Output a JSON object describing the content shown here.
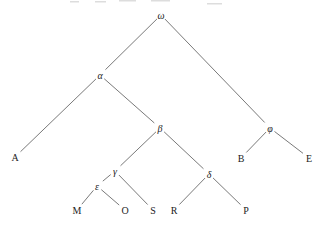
{
  "figure": {
    "width": 323,
    "height": 228,
    "background_color": "#ffffff",
    "edge_color": "#6a6a6a",
    "edge_width": 0.9,
    "label_color": "#222222"
  },
  "tree": {
    "type": "tree",
    "root": "omega",
    "nodes": [
      {
        "id": "omega",
        "label": "ω",
        "greek": true,
        "x": 161,
        "y": 15
      },
      {
        "id": "alpha",
        "label": "α",
        "greek": true,
        "x": 100,
        "y": 75
      },
      {
        "id": "phi",
        "label": "φ",
        "greek": true,
        "x": 270,
        "y": 128
      },
      {
        "id": "beta",
        "label": "β",
        "greek": true,
        "x": 160,
        "y": 128
      },
      {
        "id": "gamma",
        "label": "γ",
        "greek": true,
        "x": 115,
        "y": 171
      },
      {
        "id": "delta",
        "label": "δ",
        "greek": true,
        "x": 209,
        "y": 174
      },
      {
        "id": "epsilon",
        "label": "ε",
        "greek": true,
        "x": 97,
        "y": 186
      },
      {
        "id": "A",
        "label": "A",
        "greek": false,
        "x": 15,
        "y": 157
      },
      {
        "id": "B",
        "label": "B",
        "greek": false,
        "x": 241,
        "y": 158
      },
      {
        "id": "E",
        "label": "E",
        "greek": false,
        "x": 309,
        "y": 158
      },
      {
        "id": "M",
        "label": "M",
        "greek": false,
        "x": 77,
        "y": 210
      },
      {
        "id": "O",
        "label": "O",
        "greek": false,
        "x": 125,
        "y": 210
      },
      {
        "id": "S",
        "label": "S",
        "greek": false,
        "x": 153,
        "y": 210
      },
      {
        "id": "R",
        "label": "R",
        "greek": false,
        "x": 174,
        "y": 210
      },
      {
        "id": "P",
        "label": "P",
        "greek": false,
        "x": 246,
        "y": 210
      }
    ],
    "edges": [
      [
        "omega",
        "alpha"
      ],
      [
        "omega",
        "phi"
      ],
      [
        "alpha",
        "A"
      ],
      [
        "alpha",
        "beta"
      ],
      [
        "beta",
        "gamma"
      ],
      [
        "beta",
        "delta"
      ],
      [
        "gamma",
        "epsilon"
      ],
      [
        "gamma",
        "S"
      ],
      [
        "epsilon",
        "M"
      ],
      [
        "epsilon",
        "O"
      ],
      [
        "delta",
        "R"
      ],
      [
        "delta",
        "P"
      ],
      [
        "phi",
        "B"
      ],
      [
        "phi",
        "E"
      ]
    ]
  },
  "artifacts": {
    "top_cutoff_text_remnants": [
      {
        "x": 70,
        "y": 1,
        "w": 9
      },
      {
        "x": 95,
        "y": 1,
        "w": 11
      },
      {
        "x": 119,
        "y": 0,
        "w": 17
      },
      {
        "x": 151,
        "y": 0,
        "w": 19
      },
      {
        "x": 207,
        "y": 3,
        "w": 15
      }
    ]
  }
}
